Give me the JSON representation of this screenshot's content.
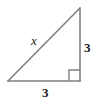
{
  "figure": {
    "type": "right-triangle-diagram",
    "background_color": "#ffffff",
    "stroke_color": "#808080",
    "stroke_width": 1.6,
    "text_color": "#1a1a1a",
    "geometry": {
      "vertex_bottom_left": [
        8,
        81
      ],
      "vertex_bottom_right": [
        80,
        81
      ],
      "vertex_top_right": [
        80,
        8
      ],
      "right_angle_vertex": [
        80,
        81
      ],
      "right_angle_marker_size": 11
    },
    "labels": {
      "hypotenuse": "x",
      "vertical_leg": "3",
      "base": "3"
    },
    "icons": {
      "right_angle_marker": "right-angle-icon"
    }
  }
}
